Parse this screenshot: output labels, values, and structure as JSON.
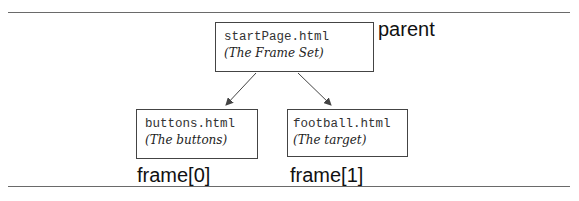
{
  "diagram": {
    "parent": {
      "file": "startPage.html",
      "description": "(The Frame Set)",
      "label": "parent"
    },
    "children": [
      {
        "file": "buttons.html",
        "description": "(The buttons)",
        "label": "frame[0]"
      },
      {
        "file": "football.html",
        "description": "(The target)",
        "label": "frame[1]"
      }
    ],
    "edges": [
      {
        "from": "startPage.html",
        "to": "buttons.html"
      },
      {
        "from": "startPage.html",
        "to": "football.html"
      }
    ]
  }
}
